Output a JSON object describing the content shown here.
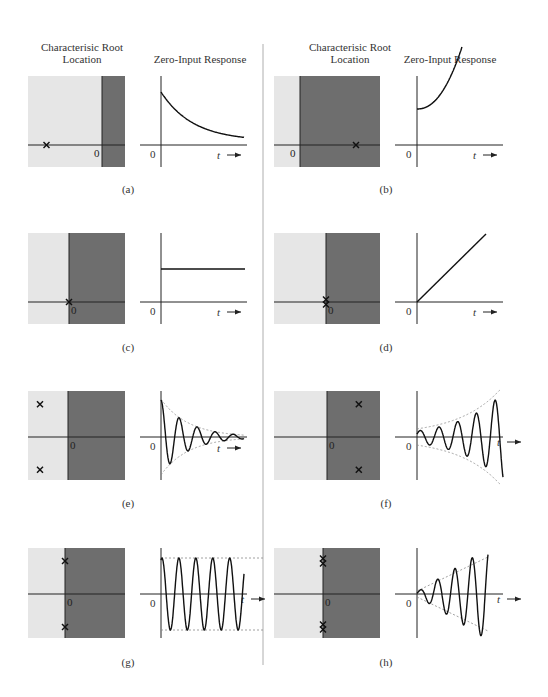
{
  "columns": [
    {
      "root_header": "Characterisic Root\nLocation",
      "response_header": "Zero-Input Response"
    },
    {
      "root_header": "Characterisic Root\nLocation",
      "response_header": "Zero-Input Response"
    }
  ],
  "axis_labels": {
    "origin": "0",
    "time": "t"
  },
  "colors": {
    "stable_region": "#e6e6e6",
    "unstable_region": "#6e6e6e",
    "axis": "#222222",
    "envelope": "#888888"
  },
  "panels": [
    {
      "id": "a",
      "caption": "(a)",
      "roots": [
        {
          "re": -0.75,
          "im": 0
        }
      ],
      "response": "decaying exponential"
    },
    {
      "id": "b",
      "caption": "(b)",
      "roots": [
        {
          "re": 0.7,
          "im": 0
        }
      ],
      "response": "growing exponential"
    },
    {
      "id": "c",
      "caption": "(c)",
      "roots": [
        {
          "re": 0,
          "im": 0
        }
      ],
      "response": "constant"
    },
    {
      "id": "d",
      "caption": "(d)",
      "roots": [
        {
          "re": 0,
          "im": 0,
          "multiplicity": 2
        }
      ],
      "response": "ramp"
    },
    {
      "id": "e",
      "caption": "(e)",
      "roots": [
        {
          "re": -0.7,
          "im": 0.7
        },
        {
          "re": -0.7,
          "im": -0.7
        }
      ],
      "response": "decaying oscillation"
    },
    {
      "id": "f",
      "caption": "(f)",
      "roots": [
        {
          "re": 0.6,
          "im": 0.7
        },
        {
          "re": 0.6,
          "im": -0.7
        }
      ],
      "response": "growing oscillation"
    },
    {
      "id": "g",
      "caption": "(g)",
      "roots": [
        {
          "re": 0,
          "im": 0.7
        },
        {
          "re": 0,
          "im": -0.7
        }
      ],
      "response": "sustained oscillation"
    },
    {
      "id": "h",
      "caption": "(h)",
      "roots": [
        {
          "re": 0,
          "im": 0.7,
          "multiplicity": 2
        },
        {
          "re": 0,
          "im": -0.7,
          "multiplicity": 2
        }
      ],
      "response": "linearly growing oscillation"
    }
  ]
}
